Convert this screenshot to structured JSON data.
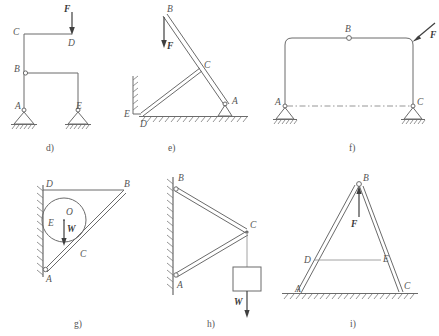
{
  "figure": {
    "panels": [
      {
        "id": "d",
        "caption": "d)",
        "nodes": [
          {
            "label": "C",
            "x": 22,
            "y": 33
          },
          {
            "label": "D",
            "x": 72,
            "y": 47
          },
          {
            "label": "B",
            "x": 22,
            "y": 72
          },
          {
            "label": "A",
            "x": 22,
            "y": 109
          },
          {
            "label": "E",
            "x": 78,
            "y": 109
          }
        ],
        "force": {
          "label": "F",
          "direction": "down",
          "point": "D"
        },
        "supports": [
          "A",
          "E"
        ],
        "support_type": "pin",
        "hinge_at": "B"
      },
      {
        "id": "e",
        "caption": "e)",
        "nodes": [
          {
            "label": "B",
            "x": 167,
            "y": 17
          },
          {
            "label": "C",
            "x": 202,
            "y": 71
          },
          {
            "label": "A",
            "x": 224,
            "y": 108
          },
          {
            "label": "E",
            "x": 123,
            "y": 113
          },
          {
            "label": "D",
            "x": 140,
            "y": 124
          }
        ],
        "force": {
          "label": "F",
          "direction": "down",
          "point": "B"
        },
        "supports": [
          "A"
        ],
        "support_type": "pin"
      },
      {
        "id": "f",
        "caption": "f)",
        "nodes": [
          {
            "label": "B",
            "x": 349,
            "y": 38
          },
          {
            "label": "A",
            "x": 285,
            "y": 106
          },
          {
            "label": "C",
            "x": 413,
            "y": 106
          }
        ],
        "force": {
          "label": "F",
          "direction": "down-left-diagonal",
          "point": "top-right-corner"
        },
        "supports": [
          "A",
          "C"
        ],
        "support_type": "pin",
        "hinge_at": "B",
        "has_dashed_tie": true
      },
      {
        "id": "g",
        "caption": "g)",
        "nodes": [
          {
            "label": "D",
            "x": 44,
            "y": 190
          },
          {
            "label": "B",
            "x": 125,
            "y": 190
          },
          {
            "label": "O",
            "x": 66,
            "y": 220
          },
          {
            "label": "E",
            "x": 48,
            "y": 230
          },
          {
            "label": "C",
            "x": 80,
            "y": 256
          },
          {
            "label": "A",
            "x": 46,
            "y": 272
          }
        ],
        "force": {
          "label": "W",
          "direction": "down",
          "point": "O"
        },
        "wall": "left-vertical",
        "has_cylinder": true
      },
      {
        "id": "h",
        "caption": "h)",
        "nodes": [
          {
            "label": "B",
            "x": 178,
            "y": 184
          },
          {
            "label": "C",
            "x": 247,
            "y": 228
          },
          {
            "label": "A",
            "x": 178,
            "y": 278
          }
        ],
        "force": {
          "label": "W",
          "direction": "down",
          "point": "block below C"
        },
        "wall": "left-vertical",
        "has_block": true
      },
      {
        "id": "i",
        "caption": "i)",
        "nodes": [
          {
            "label": "B",
            "x": 358,
            "y": 184
          },
          {
            "label": "D",
            "x": 312,
            "y": 247
          },
          {
            "label": "E",
            "x": 381,
            "y": 247
          },
          {
            "label": "A",
            "x": 298,
            "y": 292
          },
          {
            "label": "C",
            "x": 398,
            "y": 292
          }
        ],
        "force": {
          "label": "F",
          "direction": "up",
          "point": "B"
        },
        "ground": "bottom-hatched",
        "has_tie_bar": true
      }
    ],
    "labels": {
      "A": "A",
      "B": "B",
      "C": "C",
      "D": "D",
      "E": "E",
      "O": "O",
      "F": "F",
      "W": "W"
    },
    "captions": {
      "d": "d)",
      "e": "e)",
      "f": "f)",
      "g": "g)",
      "h": "h)",
      "i": "i)"
    }
  }
}
